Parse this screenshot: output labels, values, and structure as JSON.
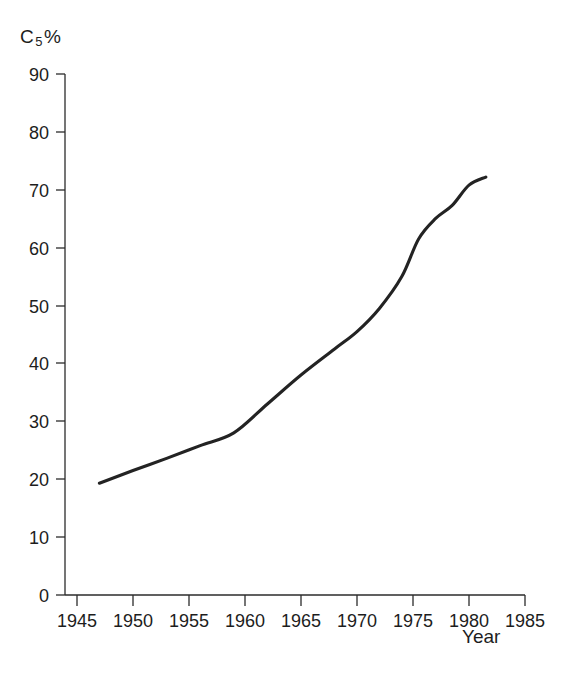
{
  "chart_data": {
    "type": "line",
    "title": "",
    "subtitle": "",
    "ylabel": "C5%",
    "ylabel_base": "C",
    "ylabel_sub": "5",
    "ylabel_suffix": "%",
    "xlabel": "Year",
    "xlim": [
      1943.5,
      1985
    ],
    "ylim": [
      0,
      90
    ],
    "grid": false,
    "legend": null,
    "xticks": [
      1945,
      1950,
      1955,
      1960,
      1965,
      1970,
      1975,
      1980,
      1985
    ],
    "xtick_labels": [
      "1945",
      "1950",
      "1955",
      "1960",
      "1965",
      "1970",
      "1975",
      "1980",
      "1985"
    ],
    "yticks": [
      0,
      10,
      20,
      30,
      40,
      50,
      60,
      70,
      80,
      90
    ],
    "ytick_labels": [
      "0",
      "10",
      "20",
      "30",
      "40",
      "50",
      "60",
      "70",
      "80",
      "90"
    ],
    "line_color": "#232323",
    "axis_color": "#2b2b2b",
    "background_color": "#ffffff",
    "series": [
      {
        "name": "C5 concentration ratio",
        "x": [
          1947.0,
          1950.0,
          1953.0,
          1956.0,
          1959.0,
          1962.0,
          1965.0,
          1968.0,
          1970.0,
          1972.0,
          1974.0,
          1975.5,
          1977.0,
          1978.5,
          1980.0,
          1981.5
        ],
        "values": [
          19.3,
          21.5,
          23.6,
          25.8,
          28.0,
          33.0,
          38.0,
          42.5,
          45.5,
          49.5,
          55.0,
          61.5,
          65.0,
          67.3,
          70.8,
          72.2
        ]
      }
    ]
  }
}
